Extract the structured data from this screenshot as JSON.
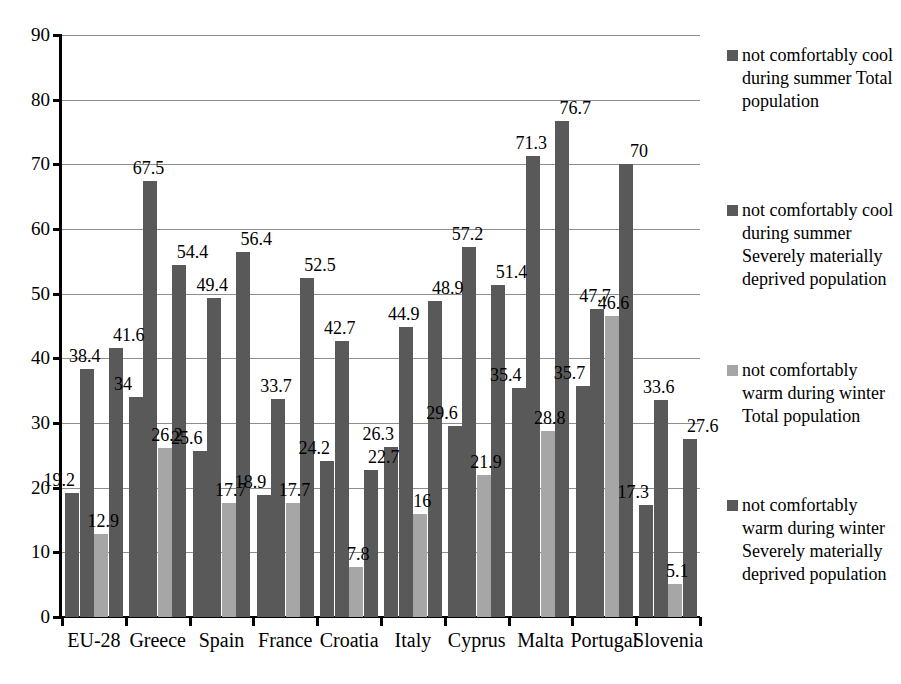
{
  "chart_data": {
    "type": "bar",
    "title": "",
    "subtitle": "",
    "xlabel": "",
    "ylabel": "",
    "ylim": [
      0,
      90
    ],
    "ytick_step": 10,
    "yticks": [
      0,
      10,
      20,
      30,
      40,
      50,
      60,
      70,
      80,
      90
    ],
    "grid": true,
    "legend_position": "right",
    "categories": [
      "EU-28",
      "Greece",
      "Spain",
      "France",
      "Croatia",
      "Italy",
      "Cyprus",
      "Malta",
      "Portugal",
      "Slovenia"
    ],
    "series": [
      {
        "name": "not comfortably cool during summer  Total population",
        "color": "#595959",
        "values": [
          19.2,
          34,
          25.6,
          18.9,
          24.2,
          26.3,
          29.6,
          35.4,
          35.7,
          17.3
        ],
        "labels": [
          "19.2",
          "34",
          "25.6",
          "18.9",
          "24.2",
          "26.3",
          "29.6",
          "35.4",
          "35.7",
          "17.3"
        ]
      },
      {
        "name": "not comfortably cool during summer Severely materially deprived population",
        "color": "#595959",
        "values": [
          38.4,
          67.5,
          49.4,
          33.7,
          42.7,
          44.9,
          57.2,
          71.3,
          47.7,
          33.6
        ],
        "labels": [
          "38.4",
          "67.5",
          "49.4",
          "33.7",
          "42.7",
          "44.9",
          "57.2",
          "71.3",
          "47.7",
          "33.6"
        ]
      },
      {
        "name": "not comfortably warm during winter Total population",
        "color": "#a6a6a6",
        "values": [
          12.9,
          26.2,
          17.7,
          17.7,
          7.8,
          16,
          21.9,
          28.8,
          46.6,
          5.1
        ],
        "labels": [
          "12.9",
          "26.2",
          "17.7",
          "17.7",
          "7.8",
          "16",
          "21.9",
          "28.8",
          "46.6",
          "5.1"
        ]
      },
      {
        "name": "not comfortably warm during winter Severely materially deprived population",
        "color": "#595959",
        "values": [
          41.6,
          54.4,
          56.4,
          52.5,
          22.7,
          48.9,
          51.4,
          76.7,
          70,
          27.6
        ],
        "labels": [
          "41.6",
          "54.4",
          "56.4",
          "52.5",
          "22.7",
          "48.9",
          "51.4",
          "76.7",
          "70",
          "27.6"
        ]
      }
    ]
  },
  "legend": {
    "entries": [
      {
        "label": "not comfortably cool during summer  Total population",
        "color": "#595959",
        "top": 0
      },
      {
        "label": "not comfortably cool during summer Severely materially deprived population",
        "color": "#595959",
        "top": 155
      },
      {
        "label": "not comfortably warm during winter Total population",
        "color": "#a6a6a6",
        "top": 315
      },
      {
        "label": "not comfortably warm during winter Severely materially deprived population",
        "color": "#595959",
        "top": 450
      }
    ]
  },
  "axis": {
    "y_labels": [
      "90",
      "80",
      "70",
      "60",
      "50",
      "40",
      "30",
      "20",
      "10",
      "0"
    ],
    "x_labels": [
      "EU-28",
      "Greece",
      "Spain",
      "France",
      "Croatia",
      "Italy",
      "Cyprus",
      "Malta",
      "Portugal",
      "Slovenia"
    ]
  },
  "colors": {
    "bar_dark": "#595959",
    "bar_light": "#a6a6a6",
    "gridline": "#8d8d8d",
    "axis": "#000000",
    "background": "#ffffff"
  }
}
